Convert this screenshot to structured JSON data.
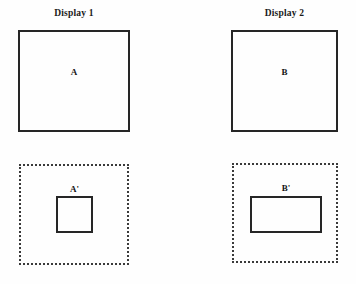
{
  "figure": {
    "background_color": "#fefefe",
    "stroke_color": "#262626",
    "dotted_stroke_color": "#3a3a3a"
  },
  "panels": [
    {
      "title": "Display 1",
      "top_shape": {
        "label": "A",
        "border_style": "solid",
        "shape": "square"
      },
      "bottom_frame": {
        "border_style": "dotted",
        "shape": "square"
      },
      "bottom_shape": {
        "label": "A'",
        "border_style": "solid",
        "shape": "square"
      }
    },
    {
      "title": "Display 2",
      "top_shape": {
        "label": "B",
        "border_style": "solid",
        "shape": "square"
      },
      "bottom_frame": {
        "border_style": "dotted",
        "shape": "square"
      },
      "bottom_shape": {
        "label": "B'",
        "border_style": "solid",
        "shape": "rectangle"
      }
    }
  ]
}
